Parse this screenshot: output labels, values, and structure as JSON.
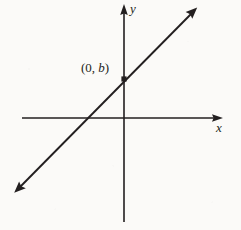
{
  "figure": {
    "type": "line-graph-diagram",
    "background_color": "#fbfaf8",
    "ink_color": "#231f20",
    "width": 241,
    "height": 230
  },
  "labels": {
    "y_axis": "y",
    "x_axis": "x",
    "intercept_prefix": "(0, ",
    "intercept_variable": "b",
    "intercept_suffix": ")",
    "intercept_full": "(0, b)"
  },
  "chart_data": {
    "type": "line",
    "title": "",
    "subtitle": "",
    "xlabel": "x",
    "ylabel": "y",
    "grid": false,
    "legend": null,
    "axes": {
      "x_axis": {
        "y_pixel": 118,
        "x_start_pixel": 22,
        "x_end_pixel": 222,
        "arrow_right": true,
        "arrow_left": false,
        "label": "x"
      },
      "y_axis": {
        "x_pixel": 124,
        "y_top_pixel": 5,
        "y_bottom_pixel": 222,
        "arrow_up": true,
        "arrow_down": false,
        "label": "y"
      },
      "origin_pixel": [
        124,
        118
      ]
    },
    "series": [
      {
        "name": "y = mx + b",
        "kind": "straight-line",
        "slope_approx": 1.0,
        "arrow_both_ends": true,
        "endpoints_pixel": [
          [
            14,
            192
          ],
          [
            197,
            8
          ]
        ],
        "y_intercept_pixel": [
          124,
          79
        ],
        "x_intercept_pixel": [
          84,
          118
        ]
      }
    ],
    "annotations": [
      {
        "text": "(0, b)",
        "target_pixel": [
          124,
          79
        ],
        "label_pixel": [
          81,
          61
        ],
        "marker": "filled-dot"
      }
    ]
  }
}
